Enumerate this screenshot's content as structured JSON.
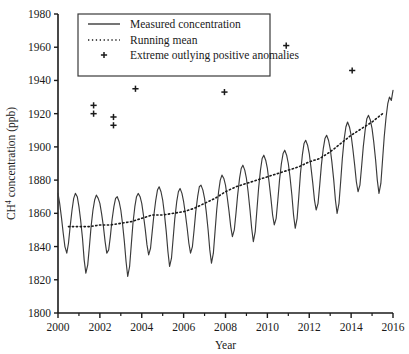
{
  "chart_data": {
    "type": "line",
    "title": "",
    "xlabel": "Year",
    "ylabel": "CH4 concentration (ppb)",
    "ylabel_base": "CH",
    "ylabel_sup": "4",
    "ylabel_rest": " concentration (ppb)",
    "xlim": [
      2000,
      2016
    ],
    "ylim": [
      1800,
      1980
    ],
    "grid": false,
    "xticks": [
      2000,
      2002,
      2004,
      2006,
      2008,
      2010,
      2012,
      2014,
      2016
    ],
    "xtick_labels": [
      "2000",
      "2002",
      "2004",
      "2006",
      "2008",
      "2010",
      "2012",
      "2014",
      "2016"
    ],
    "xminor_ticks": [
      2001,
      2003,
      2005,
      2007,
      2009,
      2011,
      2013,
      2015
    ],
    "yticks": [
      1800,
      1820,
      1840,
      1860,
      1880,
      1900,
      1920,
      1940,
      1960,
      1980
    ],
    "ytick_labels": [
      "1800",
      "1820",
      "1840",
      "1860",
      "1880",
      "1900",
      "1920",
      "1940",
      "1960",
      "1980"
    ],
    "legend_position": "top-left",
    "series": [
      {
        "name": "Measured concentration",
        "style": "solid",
        "color": "#3a3a3a",
        "x": [
          2000.0,
          2000.08,
          2000.17,
          2000.25,
          2000.33,
          2000.42,
          2000.5,
          2000.58,
          2000.67,
          2000.75,
          2000.83,
          2000.92,
          2001.0,
          2001.08,
          2001.17,
          2001.25,
          2001.33,
          2001.42,
          2001.5,
          2001.58,
          2001.67,
          2001.75,
          2001.83,
          2001.92,
          2002.0,
          2002.08,
          2002.17,
          2002.25,
          2002.33,
          2002.42,
          2002.5,
          2002.58,
          2002.67,
          2002.75,
          2002.83,
          2002.92,
          2003.0,
          2003.08,
          2003.17,
          2003.25,
          2003.33,
          2003.42,
          2003.5,
          2003.58,
          2003.67,
          2003.75,
          2003.83,
          2003.92,
          2004.0,
          2004.08,
          2004.17,
          2004.25,
          2004.33,
          2004.42,
          2004.5,
          2004.58,
          2004.67,
          2004.75,
          2004.83,
          2004.92,
          2005.0,
          2005.08,
          2005.17,
          2005.25,
          2005.33,
          2005.42,
          2005.5,
          2005.58,
          2005.67,
          2005.75,
          2005.83,
          2005.92,
          2006.0,
          2006.08,
          2006.17,
          2006.25,
          2006.33,
          2006.42,
          2006.5,
          2006.58,
          2006.67,
          2006.75,
          2006.83,
          2006.92,
          2007.0,
          2007.08,
          2007.17,
          2007.25,
          2007.33,
          2007.42,
          2007.5,
          2007.58,
          2007.67,
          2007.75,
          2007.83,
          2007.92,
          2008.0,
          2008.08,
          2008.17,
          2008.25,
          2008.33,
          2008.42,
          2008.5,
          2008.58,
          2008.67,
          2008.75,
          2008.83,
          2008.92,
          2009.0,
          2009.08,
          2009.17,
          2009.25,
          2009.33,
          2009.42,
          2009.5,
          2009.58,
          2009.67,
          2009.75,
          2009.83,
          2009.92,
          2010.0,
          2010.08,
          2010.17,
          2010.25,
          2010.33,
          2010.42,
          2010.5,
          2010.58,
          2010.67,
          2010.75,
          2010.83,
          2010.92,
          2011.0,
          2011.08,
          2011.17,
          2011.25,
          2011.33,
          2011.42,
          2011.5,
          2011.58,
          2011.67,
          2011.75,
          2011.83,
          2011.92,
          2012.0,
          2012.08,
          2012.17,
          2012.25,
          2012.33,
          2012.42,
          2012.5,
          2012.58,
          2012.67,
          2012.75,
          2012.83,
          2012.92,
          2013.0,
          2013.08,
          2013.17,
          2013.25,
          2013.33,
          2013.42,
          2013.5,
          2013.58,
          2013.67,
          2013.75,
          2013.83,
          2013.92,
          2014.0,
          2014.08,
          2014.17,
          2014.25,
          2014.33,
          2014.42,
          2014.5,
          2014.58,
          2014.67,
          2014.75,
          2014.83,
          2014.92,
          2015.0,
          2015.08,
          2015.17,
          2015.25,
          2015.33,
          2015.42,
          2015.5,
          2015.58,
          2015.67,
          2015.75,
          2015.83,
          2015.92,
          2016.0
        ],
        "y": [
          1872,
          1866,
          1857,
          1848,
          1840,
          1836,
          1842,
          1852,
          1862,
          1869,
          1872,
          1870,
          1864,
          1856,
          1845,
          1832,
          1824,
          1829,
          1840,
          1852,
          1862,
          1868,
          1871,
          1869,
          1866,
          1860,
          1852,
          1843,
          1836,
          1838,
          1846,
          1856,
          1864,
          1869,
          1870,
          1867,
          1862,
          1854,
          1843,
          1831,
          1822,
          1828,
          1841,
          1854,
          1864,
          1870,
          1872,
          1870,
          1866,
          1859,
          1850,
          1841,
          1835,
          1839,
          1849,
          1859,
          1868,
          1874,
          1876,
          1873,
          1868,
          1860,
          1849,
          1837,
          1828,
          1833,
          1845,
          1857,
          1867,
          1873,
          1875,
          1872,
          1867,
          1860,
          1851,
          1842,
          1836,
          1840,
          1850,
          1861,
          1870,
          1876,
          1877,
          1874,
          1869,
          1861,
          1850,
          1838,
          1830,
          1836,
          1849,
          1862,
          1873,
          1880,
          1883,
          1881,
          1877,
          1870,
          1861,
          1852,
          1846,
          1850,
          1860,
          1871,
          1881,
          1887,
          1889,
          1886,
          1881,
          1873,
          1862,
          1851,
          1843,
          1849,
          1862,
          1875,
          1886,
          1893,
          1895,
          1892,
          1887,
          1879,
          1869,
          1859,
          1853,
          1857,
          1868,
          1880,
          1890,
          1896,
          1898,
          1895,
          1890,
          1882,
          1871,
          1859,
          1851,
          1857,
          1870,
          1884,
          1895,
          1902,
          1904,
          1901,
          1896,
          1888,
          1878,
          1868,
          1862,
          1866,
          1877,
          1889,
          1899,
          1905,
          1907,
          1904,
          1899,
          1891,
          1880,
          1868,
          1860,
          1866,
          1879,
          1893,
          1905,
          1912,
          1915,
          1912,
          1907,
          1899,
          1889,
          1879,
          1873,
          1877,
          1888,
          1900,
          1910,
          1917,
          1919,
          1916,
          1911,
          1903,
          1892,
          1880,
          1872,
          1878,
          1892,
          1906,
          1918,
          1926,
          1930,
          1928,
          1934
        ]
      },
      {
        "name": "Running mean",
        "style": "dotted",
        "color": "#1a1a1a",
        "x": [
          2000.5,
          2001.0,
          2001.5,
          2002.0,
          2002.5,
          2003.0,
          2003.5,
          2004.0,
          2004.5,
          2005.0,
          2005.5,
          2006.0,
          2006.5,
          2007.0,
          2007.5,
          2008.0,
          2008.5,
          2009.0,
          2009.5,
          2010.0,
          2010.5,
          2011.0,
          2011.5,
          2012.0,
          2012.5,
          2013.0,
          2013.5,
          2014.0,
          2014.5,
          2015.0,
          2015.5
        ],
        "y": [
          1852,
          1852,
          1852,
          1853,
          1853,
          1854,
          1855,
          1857,
          1859,
          1859,
          1860,
          1861,
          1863,
          1866,
          1869,
          1873,
          1876,
          1878,
          1880,
          1882,
          1884,
          1886,
          1888,
          1891,
          1893,
          1897,
          1902,
          1907,
          1911,
          1915,
          1920
        ]
      }
    ],
    "outliers": {
      "name": "Extreme outlying positive anomalies",
      "marker": "+",
      "color": "#1a1a1a",
      "points": [
        {
          "x": 2001.7,
          "y": 1925
        },
        {
          "x": 2001.7,
          "y": 1920
        },
        {
          "x": 2002.65,
          "y": 1918
        },
        {
          "x": 2002.65,
          "y": 1913
        },
        {
          "x": 2003.7,
          "y": 1935
        },
        {
          "x": 2007.95,
          "y": 1933
        },
        {
          "x": 2010.9,
          "y": 1961
        },
        {
          "x": 2014.05,
          "y": 1946
        }
      ]
    },
    "legend": [
      {
        "label": "Measured concentration",
        "marker": "solid-line"
      },
      {
        "label": "Running mean",
        "marker": "dotted-line"
      },
      {
        "label": "Extreme outlying positive anomalies",
        "marker": "plus"
      }
    ]
  }
}
